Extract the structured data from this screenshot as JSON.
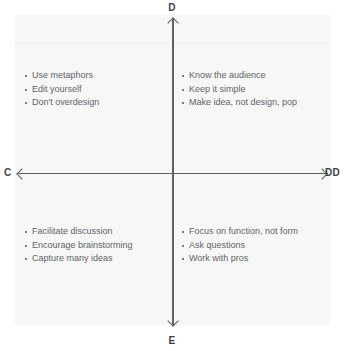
{
  "diagram": {
    "type": "quadrant-chart",
    "axes": {
      "top_label": "D",
      "bottom_label": "E",
      "left_label": "C",
      "right_label": "DD"
    },
    "quadrants": {
      "top_left": {
        "items": [
          "Use metaphors",
          "Edit yourself",
          "Don't overdesign"
        ]
      },
      "top_right": {
        "items": [
          "Know the audience",
          "Keep it simple",
          "Make idea, not design, pop"
        ]
      },
      "bottom_left": {
        "items": [
          "Facilitate discussion",
          "Encourage brainstorming",
          "Capture many ideas"
        ]
      },
      "bottom_right": {
        "items": [
          "Focus on function, not form",
          "Ask questions",
          "Work with pros"
        ]
      }
    },
    "colors": {
      "panel_background": "#f7f7f7",
      "axis_line": "#5b6063",
      "text": "#5f6468",
      "label_text": "#3d4246"
    }
  }
}
